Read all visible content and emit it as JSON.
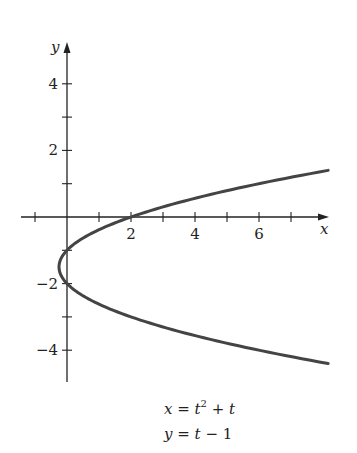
{
  "chart_data": {
    "type": "line",
    "title": "",
    "xlabel": "x",
    "ylabel": "y",
    "xlim": [
      -1.4,
      8.3
    ],
    "ylim": [
      -5.0,
      5.2
    ],
    "grid": false,
    "x_ticks": [
      -1,
      1,
      2,
      3,
      4,
      5,
      6,
      7
    ],
    "x_tick_labels": [
      {
        "value": 2,
        "label": "2"
      },
      {
        "value": 4,
        "label": "4"
      },
      {
        "value": 6,
        "label": "6"
      }
    ],
    "y_ticks": [
      -4,
      -3,
      -2,
      -1,
      1,
      2,
      3,
      4
    ],
    "y_tick_labels": [
      {
        "value": 4,
        "label": "4"
      },
      {
        "value": 2,
        "label": "2"
      },
      {
        "value": -2,
        "label": "−2"
      },
      {
        "value": -4,
        "label": "−4"
      }
    ],
    "series": [
      {
        "name": "parametric curve",
        "parametric": {
          "x": "t^2 + t",
          "y": "t - 1",
          "t_range": [
            -3.4,
            2.4
          ]
        },
        "color": "#444444",
        "points": [
          {
            "x": 8.16,
            "y": -4.4
          },
          {
            "x": 6.0,
            "y": -4.0
          },
          {
            "x": 3.75,
            "y": -3.5
          },
          {
            "x": 2.0,
            "y": -3.0
          },
          {
            "x": 0.75,
            "y": -2.5
          },
          {
            "x": 0.0,
            "y": -2.0
          },
          {
            "x": -0.25,
            "y": -1.5
          },
          {
            "x": 0.0,
            "y": -1.0
          },
          {
            "x": 0.75,
            "y": -0.5
          },
          {
            "x": 2.0,
            "y": 0.0
          },
          {
            "x": 3.75,
            "y": 0.5
          },
          {
            "x": 6.0,
            "y": 1.0
          },
          {
            "x": 8.16,
            "y": 1.4
          }
        ]
      }
    ],
    "annotations": [
      {
        "text": "x = t² + t"
      },
      {
        "text": "y = t − 1"
      }
    ]
  },
  "labels": {
    "x_axis": "x",
    "y_axis": "y",
    "eq1_lhs": "x",
    "eq1_eq": " = ",
    "eq1_t": "t",
    "eq1_exp": "2",
    "eq1_rest": " + ",
    "eq1_t2": "t",
    "eq2_lhs": "y",
    "eq2_eq": " = ",
    "eq2_t": "t",
    "eq2_rest": " − 1"
  },
  "colors": {
    "axis": "#222222",
    "curve": "#444444",
    "text": "#222222"
  }
}
